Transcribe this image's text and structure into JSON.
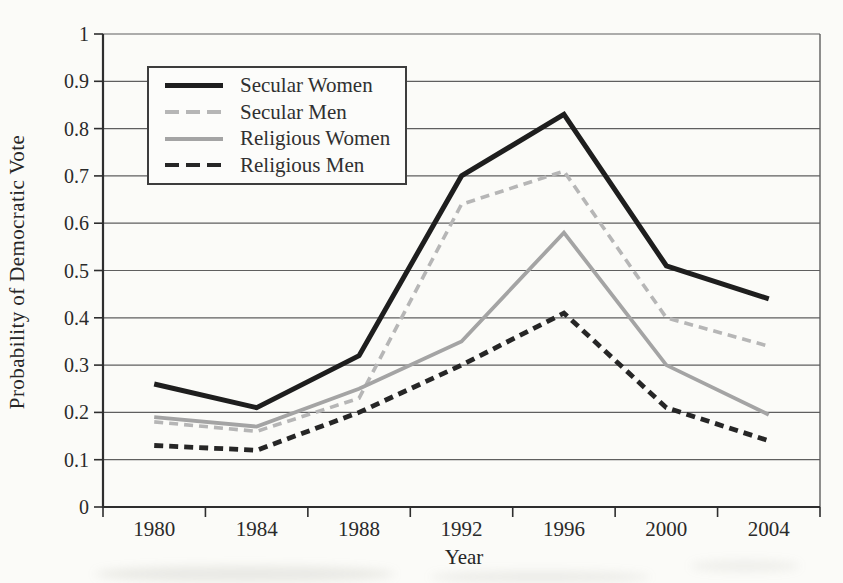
{
  "figure": {
    "background_color": "#fbfbf8",
    "grid_color": "#5f5f5f",
    "axis_color": "#2e2e2e",
    "text_color": "#2a2a2a",
    "legend_border_color": "#3d3d3d",
    "legend_background_color": "#fcfcfa"
  },
  "chart_data": {
    "type": "line",
    "title": "",
    "xlabel": "Year",
    "ylabel": "Probability of Democratic Vote",
    "categories": [
      "1980",
      "1984",
      "1988",
      "1992",
      "1996",
      "2000",
      "2004"
    ],
    "ylim": [
      0,
      1
    ],
    "ytick_step": 0.1,
    "ytick_labels": [
      "0",
      "0.1",
      "0.2",
      "0.3",
      "0.4",
      "0.5",
      "0.6",
      "0.7",
      "0.8",
      "0.9",
      "1"
    ],
    "grid": true,
    "legend_position": "upper-left-inside",
    "series": [
      {
        "name": "Secular Women",
        "values": [
          0.26,
          0.21,
          0.32,
          0.7,
          0.83,
          0.51,
          0.44
        ],
        "color": "#1e1e1e",
        "line_style": "solid",
        "width": 5
      },
      {
        "name": "Secular Men",
        "values": [
          0.18,
          0.16,
          0.23,
          0.64,
          0.71,
          0.4,
          0.34
        ],
        "color": "#b6b6b6",
        "line_style": "dashed",
        "width": 3.6
      },
      {
        "name": "Religious Women",
        "values": [
          0.19,
          0.17,
          0.25,
          0.35,
          0.58,
          0.3,
          0.195
        ],
        "color": "#a4a4a4",
        "line_style": "solid",
        "width": 3.8
      },
      {
        "name": "Religious Men",
        "values": [
          0.13,
          0.12,
          0.2,
          0.3,
          0.41,
          0.21,
          0.14
        ],
        "color": "#262626",
        "line_style": "dashed",
        "width": 4.8
      }
    ]
  }
}
